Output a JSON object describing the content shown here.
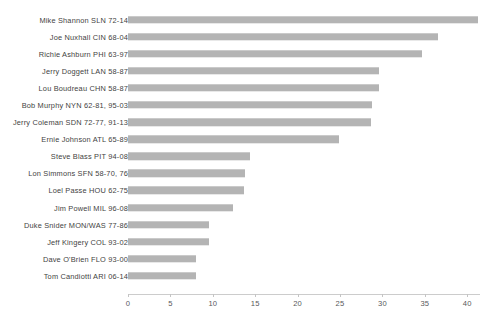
{
  "chart_data": {
    "type": "bar",
    "orientation": "horizontal",
    "title": "",
    "xlabel": "",
    "ylabel": "",
    "xlim": [
      0,
      41.5
    ],
    "xticks": [
      0,
      5,
      10,
      15,
      20,
      25,
      30,
      35,
      40
    ],
    "xticklabels": [
      "0",
      "5",
      "10",
      "15",
      "20",
      "25",
      "30",
      "35",
      "40"
    ],
    "grid": false,
    "legend": null,
    "bar_color": "#b4b4b4",
    "categories": [
      "Mike Shannon SLN 72-14",
      "Joe Nuxhall CIN 68-04",
      "Richie Ashburn PHI 63-97",
      "Jerry Doggett LAN 58-87",
      "Lou Boudreau CHN 58-87",
      "Bob Murphy NYN 62-81, 95-03",
      "Jerry Coleman SDN 72-77, 91-13",
      "Ernie Johnson ATL 65-89",
      "Steve Blass PIT 94-08",
      "Lon Simmons SFN 58-70, 76",
      "Loel Passe HOU 62-75",
      "Jim Powell MIL 96-08",
      "Duke Snider MON/WAS 77-86",
      "Jeff Kingery COL 93-02",
      "Dave O'Brien FLO 93-00",
      "Tom Candiotti ARI 06-14"
    ],
    "values": [
      41.3,
      36.5,
      34.7,
      29.6,
      29.6,
      28.8,
      28.7,
      24.9,
      14.4,
      13.8,
      13.7,
      12.4,
      9.6,
      9.6,
      8.0,
      8.0
    ]
  }
}
